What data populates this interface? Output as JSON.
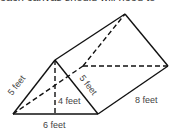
{
  "header": {
    "cut_text": "each canvas should will need to"
  },
  "diagram": {
    "type": "triangular prism",
    "labels": {
      "left_slant": "5 feet",
      "right_slant": "5 feet",
      "height": "4 feet",
      "base": "6 feet",
      "length": "8 feet"
    }
  }
}
